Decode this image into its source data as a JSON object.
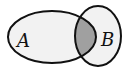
{
  "diagram": {
    "type": "venn",
    "sets": [
      {
        "label": "A",
        "cx": 52,
        "cy": 37,
        "rx": 44,
        "ry": 26
      },
      {
        "label": "B",
        "cx": 98,
        "cy": 36,
        "rx": 23,
        "ry": 30
      }
    ],
    "shaded_region": "A ∩ B",
    "colors": {
      "background": "#ffffff",
      "set_fill": "#f2f2f2",
      "intersection_fill": "#a0a0a0",
      "stroke": "#111111"
    }
  }
}
